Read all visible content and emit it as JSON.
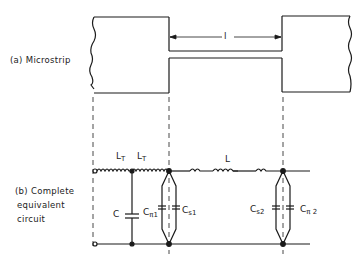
{
  "diagram": {
    "part_a": {
      "label": "(a) Microstrip",
      "dimension_label": "l"
    },
    "part_b": {
      "label_lines": [
        "(b) Complete",
        "equivalent",
        "circuit"
      ],
      "components": {
        "inductor_1": {
          "main": "L",
          "sub": "T"
        },
        "inductor_2": {
          "main": "L",
          "sub": "T"
        },
        "inductor_line": {
          "main": "L",
          "sub": ""
        },
        "cap_c": {
          "main": "C",
          "sub": ""
        },
        "cap_pi1": {
          "main": "C",
          "sub": "π1"
        },
        "cap_s1": {
          "main": "C",
          "sub": "s1"
        },
        "cap_s2": {
          "main": "C",
          "sub": "s2"
        },
        "cap_pi2": {
          "main": "C",
          "sub": "π 2"
        }
      }
    },
    "colors": {
      "line": "#1a1a1a",
      "background": "#ffffff"
    }
  }
}
